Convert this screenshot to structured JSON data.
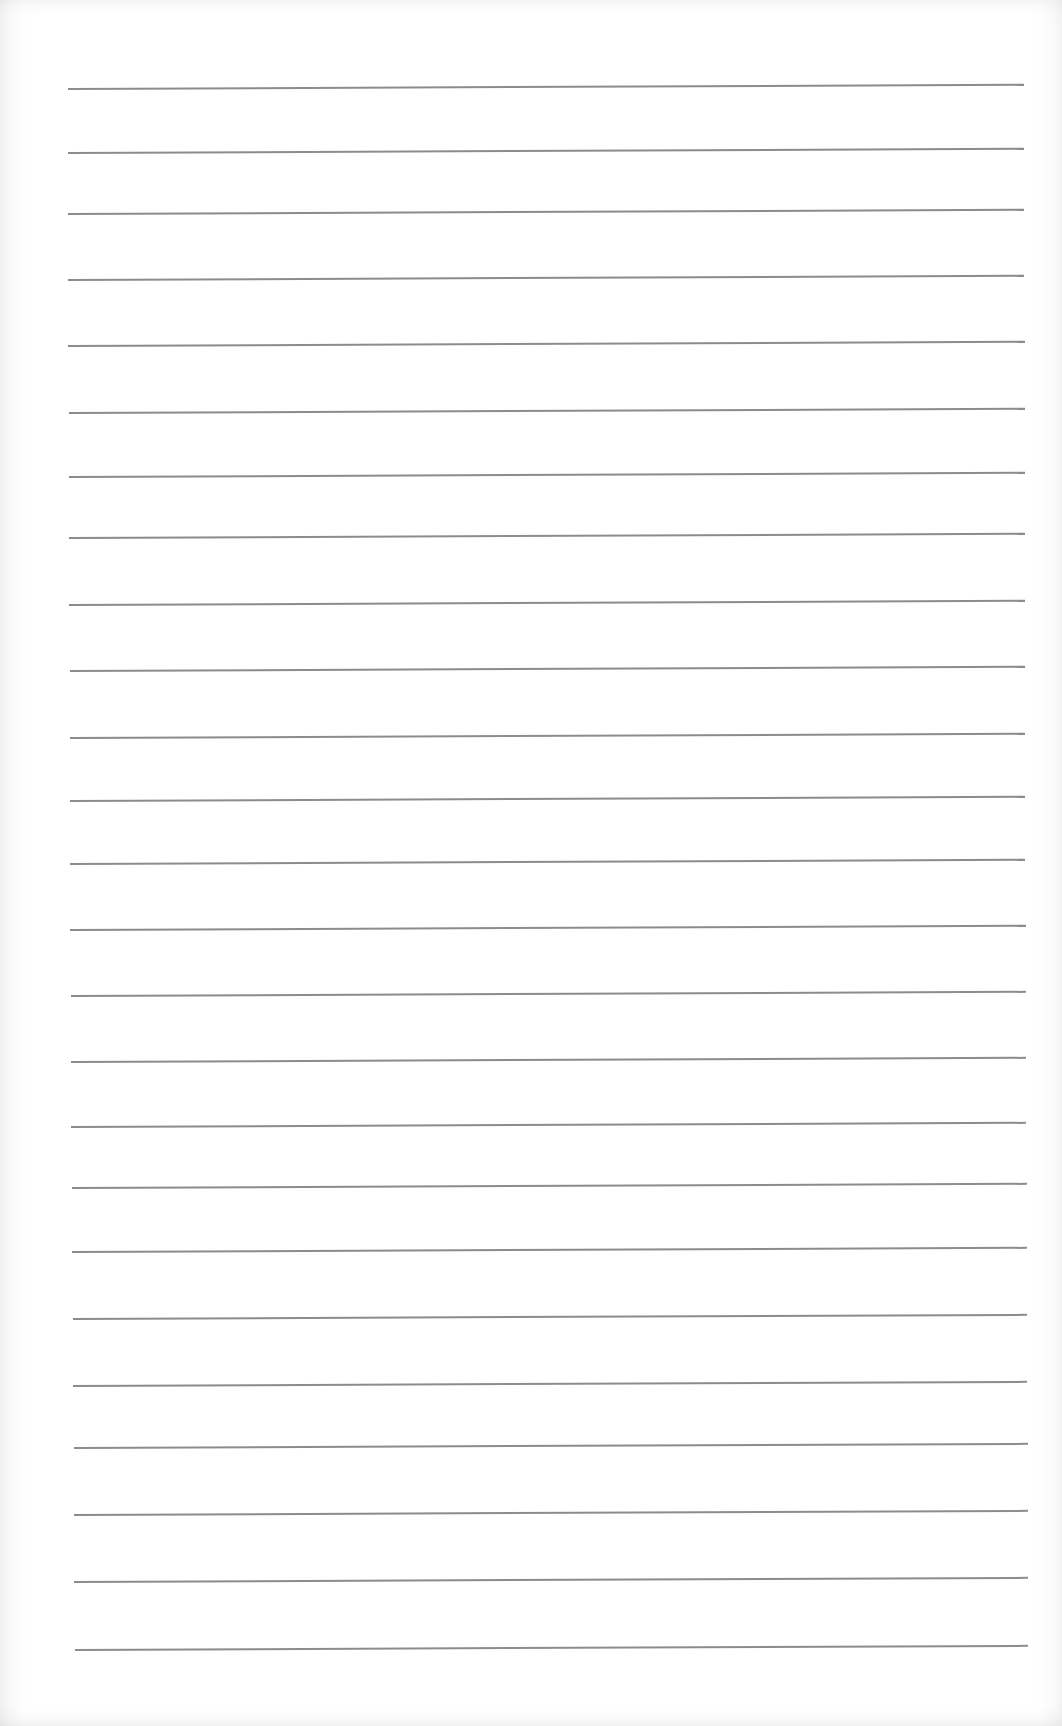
{
  "page": {
    "type": "lined-paper",
    "text_content": "",
    "colors": {
      "paper": "#ffffff",
      "rule": "#8c8c8c"
    }
  },
  "rules": [
    {
      "y": 88,
      "x1": 68,
      "x2": 1024,
      "tilt": -0.25
    },
    {
      "y": 152,
      "x1": 68,
      "x2": 1024,
      "tilt": -0.25
    },
    {
      "y": 213,
      "x1": 68,
      "x2": 1024,
      "tilt": -0.25
    },
    {
      "y": 279,
      "x1": 68,
      "x2": 1024,
      "tilt": -0.25
    },
    {
      "y": 345,
      "x1": 68,
      "x2": 1025,
      "tilt": -0.25
    },
    {
      "y": 412,
      "x1": 69,
      "x2": 1025,
      "tilt": -0.25
    },
    {
      "y": 476,
      "x1": 69,
      "x2": 1025,
      "tilt": -0.25
    },
    {
      "y": 537,
      "x1": 69,
      "x2": 1025,
      "tilt": -0.25
    },
    {
      "y": 604,
      "x1": 69,
      "x2": 1025,
      "tilt": -0.25
    },
    {
      "y": 670,
      "x1": 70,
      "x2": 1025,
      "tilt": -0.25
    },
    {
      "y": 737,
      "x1": 70,
      "x2": 1025,
      "tilt": -0.25
    },
    {
      "y": 800,
      "x1": 70,
      "x2": 1025,
      "tilt": -0.25
    },
    {
      "y": 863,
      "x1": 70,
      "x2": 1025,
      "tilt": -0.25
    },
    {
      "y": 929,
      "x1": 70,
      "x2": 1026,
      "tilt": -0.25
    },
    {
      "y": 995,
      "x1": 71,
      "x2": 1026,
      "tilt": -0.25
    },
    {
      "y": 1061,
      "x1": 71,
      "x2": 1026,
      "tilt": -0.25
    },
    {
      "y": 1126,
      "x1": 71,
      "x2": 1026,
      "tilt": -0.25
    },
    {
      "y": 1187,
      "x1": 72,
      "x2": 1027,
      "tilt": -0.25
    },
    {
      "y": 1251,
      "x1": 72,
      "x2": 1027,
      "tilt": -0.25
    },
    {
      "y": 1318,
      "x1": 73,
      "x2": 1027,
      "tilt": -0.25
    },
    {
      "y": 1385,
      "x1": 73,
      "x2": 1027,
      "tilt": -0.25
    },
    {
      "y": 1447,
      "x1": 74,
      "x2": 1028,
      "tilt": -0.25
    },
    {
      "y": 1514,
      "x1": 74,
      "x2": 1028,
      "tilt": -0.25
    },
    {
      "y": 1581,
      "x1": 74,
      "x2": 1028,
      "tilt": -0.25
    },
    {
      "y": 1649,
      "x1": 75,
      "x2": 1028,
      "tilt": -0.25
    }
  ]
}
